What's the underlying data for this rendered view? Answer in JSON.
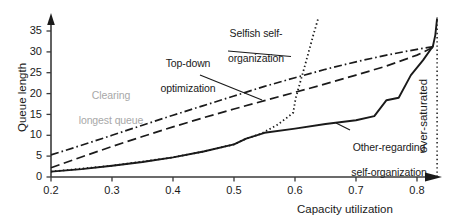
{
  "chart_data": {
    "type": "line",
    "title": "",
    "xlabel": "Capacity utilization",
    "ylabel": "Queue length",
    "xlim": [
      0.2,
      0.86
    ],
    "ylim": [
      0,
      38
    ],
    "xticks": [
      "0.2",
      "0.3",
      "0.4",
      "0.5",
      "0.6",
      "0.7",
      "0.8"
    ],
    "xtick_values": [
      0.2,
      0.3,
      0.4,
      0.5,
      0.6,
      0.7,
      0.8
    ],
    "yticks": [
      "0",
      "5",
      "10",
      "15",
      "20",
      "25",
      "30",
      "35"
    ],
    "ytick_values": [
      0,
      5,
      10,
      15,
      20,
      25,
      30,
      35
    ],
    "grid": false,
    "legend_position": "inline-annotations",
    "series": [
      {
        "name": "Clearing longest queue",
        "style": "dash-dot",
        "color": "#1a1a1a",
        "x": [
          0.2,
          0.25,
          0.3,
          0.35,
          0.4,
          0.45,
          0.5,
          0.55,
          0.6,
          0.65,
          0.7,
          0.75,
          0.8,
          0.83
        ],
        "y": [
          5.3,
          7.6,
          10.0,
          12.4,
          14.8,
          17.1,
          19.4,
          21.7,
          23.8,
          25.8,
          27.6,
          29.2,
          30.6,
          31.3
        ]
      },
      {
        "name": "Top-down optimization",
        "style": "dashed",
        "color": "#1a1a1a",
        "x": [
          0.2,
          0.25,
          0.3,
          0.35,
          0.4,
          0.45,
          0.5,
          0.55,
          0.6,
          0.65,
          0.7,
          0.75,
          0.8,
          0.83
        ],
        "y": [
          2.2,
          4.8,
          7.3,
          9.7,
          12.0,
          14.2,
          16.3,
          18.3,
          20.3,
          22.3,
          24.4,
          26.6,
          29.2,
          31.3
        ]
      },
      {
        "name": "Other-regarding self-organization",
        "style": "solid",
        "color": "#1a1a1a",
        "x": [
          0.2,
          0.25,
          0.3,
          0.35,
          0.4,
          0.45,
          0.5,
          0.52,
          0.55,
          0.6,
          0.65,
          0.7,
          0.73,
          0.75,
          0.77,
          0.79,
          0.81,
          0.826,
          0.83,
          0.833
        ],
        "y": [
          1.3,
          1.9,
          2.7,
          3.6,
          4.7,
          6.1,
          7.8,
          9.2,
          10.6,
          11.6,
          12.7,
          13.6,
          14.6,
          18.4,
          19.0,
          24.4,
          28.0,
          31.3,
          34.0,
          38.0
        ]
      },
      {
        "name": "Selfish self-organization",
        "style": "dotted",
        "color": "#1a1a1a",
        "x": [
          0.2,
          0.3,
          0.4,
          0.45,
          0.5,
          0.52,
          0.545,
          0.555,
          0.57,
          0.585,
          0.597,
          0.601,
          0.615,
          0.63,
          0.638
        ],
        "y": [
          1.3,
          2.7,
          4.7,
          6.1,
          7.8,
          9.2,
          10.4,
          11.2,
          12.4,
          14.0,
          15.4,
          18.8,
          26.0,
          34.0,
          38.0
        ]
      }
    ],
    "annotations": [
      {
        "id": "selfish-self-organization",
        "text": "Selfish self-\norganization",
        "color": "#1a1a1a",
        "leader": true
      },
      {
        "id": "top-down-optimization",
        "text": "Top-down\noptimization",
        "color": "#1a1a1a",
        "leader": true
      },
      {
        "id": "clearing-longest-queue",
        "text": "Clearing\nlongest queue",
        "color": "#a8a8a8",
        "leader": false
      },
      {
        "id": "other-regarding-self-organization",
        "text": "Other-regarding\nself-organization",
        "color": "#1a1a1a",
        "leader": true
      },
      {
        "id": "over-saturated",
        "text": "over-saturated",
        "color": "#1a1a1a",
        "leader": false,
        "orientation": "vertical",
        "marker_line": "dotted-vertical",
        "marker_x": 0.833
      }
    ]
  },
  "axes": {
    "x_title": "Capacity utilization",
    "y_title": "Queue length",
    "x_tick_labels": [
      "0.2",
      "0.3",
      "0.4",
      "0.5",
      "0.6",
      "0.7",
      "0.8"
    ],
    "y_tick_labels": [
      "0",
      "5",
      "10",
      "15",
      "20",
      "25",
      "30",
      "35"
    ]
  },
  "labels": {
    "selfish_line1": "Selfish self-",
    "selfish_line2": "organization",
    "topdown_line1": "Top-down",
    "topdown_line2": "optimization",
    "clearing_line1": "Clearing",
    "clearing_line2": "longest queue",
    "other_line1": "Other-regarding",
    "other_line2": "self-organization",
    "oversaturated": "over-saturated"
  },
  "colors": {
    "ink": "#1a1a1a",
    "gray_label": "#a8a8a8",
    "background": "#ffffff"
  }
}
